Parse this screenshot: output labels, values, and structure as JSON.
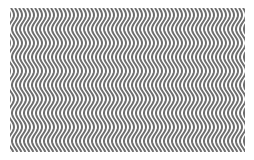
{
  "image": {
    "description": "Wavy vertical stripe optical illusion pattern",
    "colors": {
      "background": "#ffffff",
      "stripe": "#6e6e6e",
      "gap": "#ffffff"
    },
    "pattern": {
      "stripe_period_px": 4,
      "wave_period_px": 28,
      "wave_amplitude_px": 3
    }
  }
}
